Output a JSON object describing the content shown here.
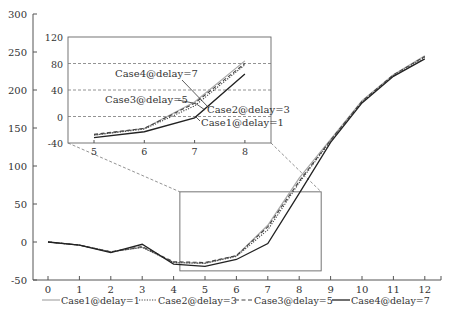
{
  "chart_data": {
    "type": "line",
    "title": "",
    "xlabel": "",
    "ylabel": "",
    "x": [
      0,
      1,
      2,
      3,
      4,
      5,
      6,
      7,
      8,
      9,
      10,
      11,
      12
    ],
    "xlim": [
      0,
      12.5
    ],
    "ylim": [
      -50,
      300
    ],
    "xticks": [
      "0",
      "1",
      "2",
      "3",
      "4",
      "5",
      "6",
      "7",
      "8",
      "9",
      "10",
      "11",
      "12"
    ],
    "yticks": [
      "-50",
      "0",
      "50",
      "100",
      "150",
      "200",
      "250",
      "300"
    ],
    "grid": false,
    "legend_position": "bottom",
    "series": [
      {
        "name": "Case1@delay=1",
        "style": "solid-light",
        "color": "#9a9a9a",
        "values": [
          0,
          -4,
          -13,
          -7,
          -27,
          -28,
          -18,
          22,
          84,
          135,
          186,
          220,
          245
        ]
      },
      {
        "name": "Case2@delay=3",
        "style": "dotted",
        "color": "#444444",
        "values": [
          0,
          -4,
          -13,
          -7,
          -27,
          -28,
          -19,
          16,
          78,
          133,
          184,
          219,
          243
        ]
      },
      {
        "name": "Case3@delay=5",
        "style": "dashed",
        "color": "#444444",
        "values": [
          0,
          -4,
          -13,
          -6,
          -26,
          -27,
          -18,
          20,
          80,
          134,
          185,
          220,
          244
        ]
      },
      {
        "name": "Case4@delay=7",
        "style": "solid-dark",
        "color": "#222222",
        "values": [
          0,
          -4,
          -14,
          -3,
          -29,
          -32,
          -23,
          -2,
          64,
          131,
          183,
          218,
          241
        ]
      }
    ],
    "inset": {
      "x_range": [
        5,
        8
      ],
      "xticks": [
        "5",
        "6",
        "7",
        "8"
      ],
      "ylim": [
        -40,
        120
      ],
      "yticks": [
        "-40",
        "0",
        "40",
        "80",
        "120"
      ],
      "grid": "horizontal-dashed",
      "zoom_box": {
        "x": [
          4.2,
          8.7
        ],
        "y": [
          -38,
          66
        ]
      },
      "annotations": [
        {
          "text": "Case4@delay=7",
          "points_to": "Case4"
        },
        {
          "text": "Case3@delay=5",
          "points_to": "Case3"
        },
        {
          "text": "Case2@delay=3",
          "points_to": "Case2"
        },
        {
          "text": "Case1@delay=1",
          "points_to": "Case1"
        }
      ]
    }
  },
  "legend": [
    {
      "label": "Case1@delay=1",
      "style": "solid-light"
    },
    {
      "label": "Case2@delay=3",
      "style": "dotted"
    },
    {
      "label": "Case3@delay=5",
      "style": "dashed"
    },
    {
      "label": "Case4@delay=7",
      "style": "solid-dark"
    }
  ],
  "inset_labels": {
    "case4": "Case4@delay=7",
    "case3": "Case3@delay=5",
    "case2": "Case2@delay=3",
    "case1": "Case1@delay=1"
  }
}
